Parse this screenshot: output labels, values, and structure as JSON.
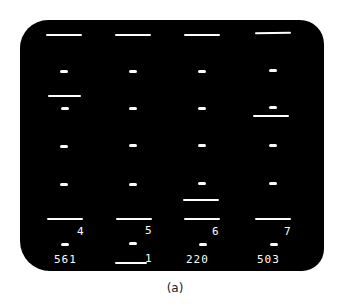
{
  "display": {
    "background": "#000000",
    "foreground": "#ffffff",
    "columns": [
      {
        "index": 1,
        "label": "4",
        "count": "561"
      },
      {
        "index": 2,
        "label": "5",
        "count": "1"
      },
      {
        "index": 3,
        "label": "6",
        "count": "220"
      },
      {
        "index": 4,
        "label": "7",
        "count": "503"
      }
    ],
    "rows": 5
  },
  "caption": "(a)"
}
